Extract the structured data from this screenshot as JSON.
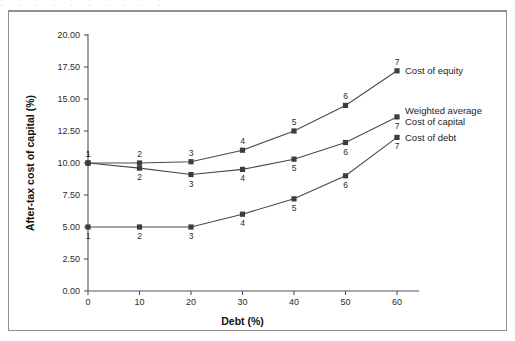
{
  "figure": {
    "ghost_text": "· · · · · · · · · ·",
    "frame_color": "#8f8f8f",
    "background": "#ffffff"
  },
  "chart_data": {
    "type": "line",
    "title": "",
    "xlabel": "Debt (%)",
    "ylabel": "After-tax cost of capital (%)",
    "x": [
      0,
      10,
      20,
      30,
      40,
      50,
      60
    ],
    "xlim": [
      0,
      60
    ],
    "ylim": [
      0.0,
      20.0
    ],
    "xticks": [
      "0",
      "10",
      "20",
      "30",
      "40",
      "50",
      "60"
    ],
    "yticks": [
      "0.00",
      "2.50",
      "5.00",
      "7.50",
      "10.00",
      "12.50",
      "15.00",
      "17.50",
      "20.00"
    ],
    "grid": false,
    "legend_position": "right-of-endpoints",
    "point_labels": [
      "1",
      "2",
      "3",
      "4",
      "5",
      "6",
      "7"
    ],
    "series": [
      {
        "name": "Cost of equity",
        "values": [
          10.0,
          10.0,
          10.1,
          11.0,
          12.5,
          14.5,
          17.2
        ],
        "label_side": [
          "above",
          "above",
          "above",
          "above",
          "above",
          "above",
          "above"
        ],
        "end_label": "Cost of equity",
        "color": "#4a4a4a"
      },
      {
        "name": "Weighted average Cost of capital",
        "values": [
          10.0,
          9.6,
          9.1,
          9.5,
          10.3,
          11.6,
          13.6
        ],
        "label_side": [
          "above",
          "below",
          "below",
          "below",
          "below",
          "below",
          "below"
        ],
        "end_label_line1": "Weighted average",
        "end_label_line2": "Cost of capital",
        "color": "#4a4a4a"
      },
      {
        "name": "Cost of debt",
        "values": [
          5.0,
          5.0,
          5.0,
          6.0,
          7.2,
          9.0,
          12.0
        ],
        "label_side": [
          "below",
          "below",
          "below",
          "below",
          "below",
          "below",
          "below"
        ],
        "end_label": "Cost of debt",
        "color": "#4a4a4a"
      }
    ]
  },
  "legend": {
    "items": [
      {
        "label": "Cost of equity"
      },
      {
        "label": "Weighted average"
      },
      {
        "label": "Cost of capital"
      },
      {
        "label": "Cost of debt"
      }
    ]
  }
}
